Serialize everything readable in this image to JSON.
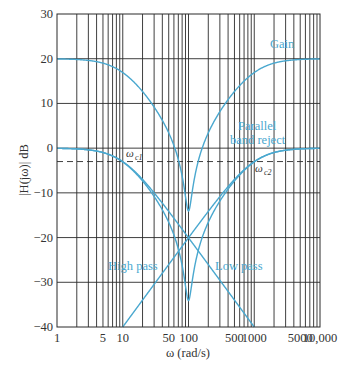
{
  "chart_data": {
    "type": "line",
    "title": "",
    "xlabel": "ω (rad/s)",
    "ylabel": "|H(jω)| dB",
    "xscale": "log",
    "xlim": [
      1,
      10000
    ],
    "ylim": [
      -40,
      30
    ],
    "grid": true,
    "x_tick_labels": [
      {
        "value": 1,
        "label": "1"
      },
      {
        "value": 5,
        "label": "5"
      },
      {
        "value": 10,
        "label": "10"
      },
      {
        "value": 50,
        "label": "50"
      },
      {
        "value": 100,
        "label": "100"
      },
      {
        "value": 500,
        "label": "500"
      },
      {
        "value": 1000,
        "label": "1000"
      },
      {
        "value": 5000,
        "label": "5000"
      },
      {
        "value": 10000,
        "label": "10,000"
      }
    ],
    "y_ticks": [
      30,
      20,
      10,
      0,
      -10,
      -20,
      -30,
      -40
    ],
    "y_tick_labels": [
      "30",
      "20",
      "10",
      "0",
      "−10",
      "−20",
      "−30",
      "−40"
    ],
    "cutoff_frequencies": {
      "wc1": 10,
      "wc2": 1000
    },
    "gain_db": 20,
    "reference_line": {
      "y": -3,
      "style": "dashed"
    },
    "series": [
      {
        "name": "Low pass",
        "formula": "-20*log10(sqrt(1+(w/wc1)^2))",
        "x": [
          1,
          10,
          100,
          1000
        ],
        "values": [
          0,
          -3,
          -20,
          -40
        ]
      },
      {
        "name": "High pass",
        "formula": "-20*log10(sqrt(1+(wc2/w)^2))",
        "x": [
          10,
          100,
          1000,
          10000
        ],
        "values": [
          -40,
          -20,
          -3,
          0
        ]
      },
      {
        "name": "Parallel band reject",
        "formula": "LP + HP (linear sum)",
        "x": [
          1,
          10,
          100,
          1000,
          10000
        ],
        "values": [
          0,
          -3,
          -17,
          -3,
          0
        ]
      },
      {
        "name": "Gain",
        "formula": "Band reject + 20 dB",
        "x": [
          1,
          10,
          100,
          1000,
          10000
        ],
        "values": [
          20,
          17,
          3,
          17,
          20
        ]
      }
    ],
    "annotations": [
      {
        "text": "ω",
        "sub": "c1",
        "x": 10,
        "y": -3
      },
      {
        "text": "ω",
        "sub": "c2",
        "x": 1000,
        "y": -3
      }
    ],
    "curve_labels": [
      {
        "text": "Gain"
      },
      {
        "text": "Parallel"
      },
      {
        "text": "band reject"
      },
      {
        "text": "High pass"
      },
      {
        "text": "Low pass"
      }
    ],
    "colors": {
      "curve": "#4aa8cf",
      "grid": "#2a2a2a",
      "text": "#333333"
    }
  }
}
